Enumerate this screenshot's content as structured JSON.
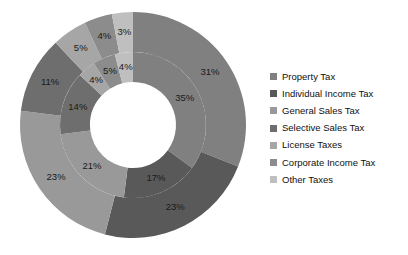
{
  "chart_data": {
    "type": "pie",
    "variant": "doughnut-two-ring",
    "title": "",
    "xlabel": "",
    "ylabel": "",
    "categories": [
      "Property Tax",
      "Individual Income Tax",
      "General Sales Tax",
      "Selective Sales Tax",
      "License Taxes",
      "Corporate Income Tax",
      "Other Taxes"
    ],
    "series": [
      {
        "name": "Inner Ring",
        "ring": "inner",
        "values": [
          35,
          17,
          21,
          14,
          4,
          5,
          4
        ],
        "labels": [
          "35%",
          "17%",
          "21%",
          "14%",
          "4%",
          "5%",
          "4%"
        ]
      },
      {
        "name": "Outer Ring",
        "ring": "outer",
        "values": [
          31,
          23,
          23,
          11,
          5,
          4,
          3
        ],
        "labels": [
          "31%",
          "23%",
          "23%",
          "11%",
          "5%",
          "4%",
          "3%"
        ]
      }
    ],
    "colors": [
      "#808080",
      "#595959",
      "#999999",
      "#6E6E6E",
      "#A6A6A6",
      "#8C8C8C",
      "#BFBFBF"
    ],
    "legend_position": "right",
    "grid": false,
    "start_angle_deg": 0,
    "direction": "clockwise"
  },
  "legend": {
    "items": [
      {
        "label": "Property Tax",
        "color": "#808080"
      },
      {
        "label": "Individual Income Tax",
        "color": "#595959"
      },
      {
        "label": "General Sales Tax",
        "color": "#999999"
      },
      {
        "label": "Selective Sales Tax",
        "color": "#6E6E6E"
      },
      {
        "label": "License Taxes",
        "color": "#A6A6A6"
      },
      {
        "label": "Corporate Income Tax",
        "color": "#8C8C8C"
      },
      {
        "label": "Other Taxes",
        "color": "#BFBFBF"
      }
    ]
  },
  "geometry": {
    "cx": 133,
    "cy": 125,
    "hole_r": 43,
    "inner_outer_r": 73,
    "outer_outer_r": 113,
    "inner_label_r": 58,
    "outer_label_r": 93
  }
}
